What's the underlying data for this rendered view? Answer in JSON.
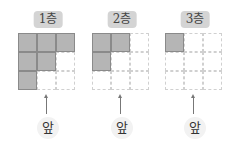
{
  "floors": [
    {
      "label": "1층",
      "grid": [
        [
          1,
          1,
          1
        ],
        [
          1,
          1,
          0
        ],
        [
          1,
          0,
          0
        ]
      ],
      "front_label": "앞"
    },
    {
      "label": "2층",
      "grid": [
        [
          1,
          1,
          0
        ],
        [
          1,
          0,
          0
        ],
        [
          0,
          0,
          0
        ]
      ],
      "front_label": "앞"
    },
    {
      "label": "3층",
      "grid": [
        [
          1,
          0,
          0
        ],
        [
          0,
          0,
          0
        ],
        [
          0,
          0,
          0
        ]
      ],
      "front_label": "앞"
    }
  ],
  "colors": {
    "filled_cell": "#b5b5b5",
    "label_bg": "#d4d4d4",
    "grid_line": "#d0d0d0"
  }
}
